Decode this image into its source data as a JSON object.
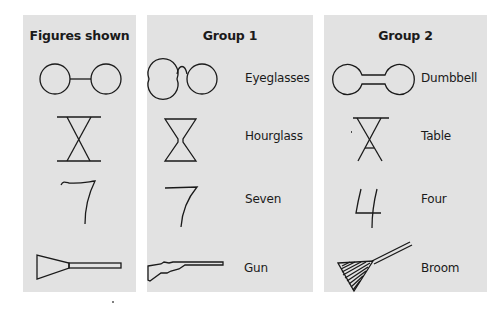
{
  "panels": [
    {
      "title": "Figures shown",
      "items": [
        {
          "figure": "two-circles-joined-by-line",
          "label": ""
        },
        {
          "figure": "crossed-lines-between-bars",
          "label": ""
        },
        {
          "figure": "handwritten-seven",
          "label": ""
        },
        {
          "figure": "triangle-with-rectangle",
          "label": ""
        }
      ]
    },
    {
      "title": "Group 1",
      "items": [
        {
          "figure": "eyeglasses",
          "label": "Eyeglasses"
        },
        {
          "figure": "hourglass",
          "label": "Hourglass"
        },
        {
          "figure": "seven",
          "label": "Seven"
        },
        {
          "figure": "gun",
          "label": "Gun"
        }
      ]
    },
    {
      "title": "Group 2",
      "items": [
        {
          "figure": "dumbbell",
          "label": "Dumbbell"
        },
        {
          "figure": "table",
          "label": "Table"
        },
        {
          "figure": "four",
          "label": "Four"
        },
        {
          "figure": "broom",
          "label": "Broom"
        }
      ]
    }
  ],
  "colors": {
    "panel_bg": "#e2e2e2",
    "stroke": "#1a1a1a",
    "page_bg": "#ffffff"
  }
}
